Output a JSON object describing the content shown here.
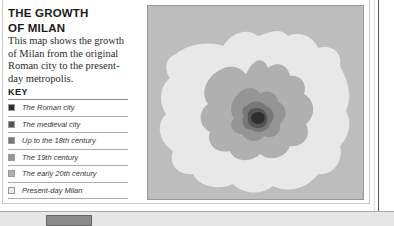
{
  "header": {
    "title_line1": "THE GROWTH",
    "title_line2": "OF MILAN",
    "description": "This map shows the growth of Milan from the original Roman city to the present-day metropolis."
  },
  "key": {
    "title": "KEY",
    "items": [
      {
        "label": "The Roman city",
        "color": "#2e2e2e"
      },
      {
        "label": "The medieval city",
        "color": "#555555"
      },
      {
        "label": "Up to the 18th century",
        "color": "#777777"
      },
      {
        "label": "The 19th century",
        "color": "#959595"
      },
      {
        "label": "The early 20th century",
        "color": "#b0b0b0"
      },
      {
        "label": "Present-day Milan",
        "color": "#e8e8e8"
      }
    ]
  },
  "map": {
    "background_color": "#bdbdbd",
    "layers": [
      "roman-city",
      "medieval-city",
      "up-to-18th-century",
      "19th-century",
      "early-20th-century",
      "present-day"
    ]
  }
}
